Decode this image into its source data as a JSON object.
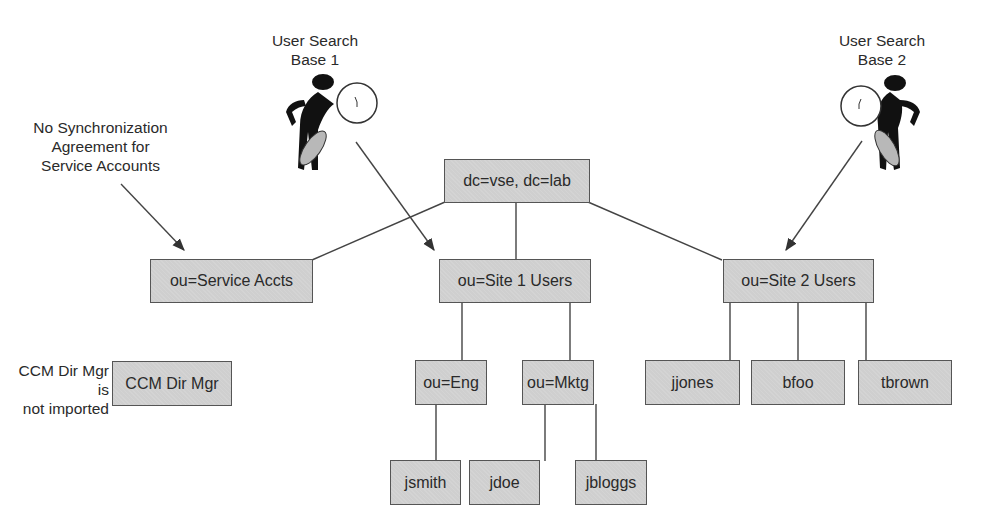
{
  "annotations": {
    "search_base_1": {
      "line1": "User Search",
      "line2": "Base 1"
    },
    "search_base_2": {
      "line1": "User Search",
      "line2": "Base 2"
    },
    "no_sync": {
      "line1": "No Synchronization",
      "line2": "Agreement for",
      "line3": "Service Accounts"
    },
    "not_imported": {
      "line1": "CCM Dir Mgr is",
      "line2": "not imported"
    }
  },
  "tree": {
    "root": "dc=vse, dc=lab",
    "service_accts": "ou=Service Accts",
    "site1": "ou=Site 1 Users",
    "site2": "ou=Site 2 Users",
    "ccm_dir_mgr": "CCM Dir Mgr",
    "eng": "ou=Eng",
    "mktg": "ou=Mktg",
    "jjones": "jjones",
    "bfoo": "bfoo",
    "tbrown": "tbrown",
    "jsmith": "jsmith",
    "jdoe": "jdoe",
    "jbloggs": "jbloggs"
  },
  "icons": {
    "searcher_1": "person-with-magnifying-glass",
    "searcher_2": "person-with-magnifying-glass"
  }
}
